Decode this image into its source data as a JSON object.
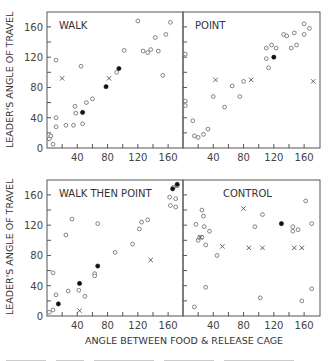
{
  "chart_data": {
    "type": "scatter",
    "layout": "2x2 panels, shared axes",
    "ylabel": "LEADER'S ANGLE OF TRAVEL",
    "xlabel": "ANGLE BETWEEN FOOD & RELEASE CAGE",
    "xticks": [
      40,
      80,
      120,
      160
    ],
    "yticks": [
      0,
      40,
      80,
      120,
      160
    ],
    "xlim": [
      0,
      180
    ],
    "ylim": [
      0,
      180
    ],
    "grid": false,
    "marker_legend": {
      "open": "open circle",
      "filled": "filled circle",
      "cross": "x"
    },
    "panels": [
      {
        "title": "WALK",
        "position": "top-left",
        "open": [
          [
            3,
            12
          ],
          [
            5,
            16
          ],
          [
            8,
            5
          ],
          [
            12,
            28
          ],
          [
            12,
            40
          ],
          [
            12,
            116
          ],
          [
            25,
            30
          ],
          [
            35,
            30
          ],
          [
            37,
            55
          ],
          [
            38,
            46
          ],
          [
            45,
            108
          ],
          [
            47,
            32
          ],
          [
            52,
            60
          ],
          [
            60,
            65
          ],
          [
            92,
            100
          ],
          [
            102,
            129
          ],
          [
            120,
            168
          ],
          [
            127,
            128
          ],
          [
            133,
            126
          ],
          [
            137,
            130
          ],
          [
            143,
            146
          ],
          [
            147,
            128
          ],
          [
            153,
            96
          ],
          [
            157,
            150
          ],
          [
            163,
            166
          ]
        ],
        "filled": [
          [
            47,
            47
          ],
          [
            78,
            81
          ],
          [
            95,
            105
          ]
        ],
        "cross": [
          [
            20,
            92
          ],
          [
            82,
            92
          ]
        ]
      },
      {
        "title": "POINT",
        "position": "top-right",
        "open": [
          [
            3,
            124
          ],
          [
            3,
            62
          ],
          [
            3,
            56
          ],
          [
            13,
            36
          ],
          [
            15,
            16
          ],
          [
            20,
            14
          ],
          [
            27,
            18
          ],
          [
            33,
            25
          ],
          [
            40,
            68
          ],
          [
            55,
            54
          ],
          [
            65,
            82
          ],
          [
            75,
            68
          ],
          [
            80,
            88
          ],
          [
            110,
            132
          ],
          [
            110,
            118
          ],
          [
            113,
            106
          ],
          [
            117,
            136
          ],
          [
            123,
            132
          ],
          [
            133,
            150
          ],
          [
            137,
            148
          ],
          [
            143,
            132
          ],
          [
            147,
            152
          ],
          [
            150,
            136
          ],
          [
            160,
            150
          ],
          [
            160,
            164
          ],
          [
            167,
            158
          ]
        ],
        "filled": [
          [
            120,
            120
          ]
        ],
        "cross": [
          [
            43,
            90
          ],
          [
            90,
            90
          ],
          [
            172,
            88
          ]
        ]
      },
      {
        "title": "WALK THEN POINT",
        "position": "bottom-left",
        "open": [
          [
            3,
            5
          ],
          [
            8,
            8
          ],
          [
            8,
            57
          ],
          [
            12,
            28
          ],
          [
            25,
            107
          ],
          [
            28,
            33
          ],
          [
            33,
            128
          ],
          [
            42,
            34
          ],
          [
            50,
            26
          ],
          [
            63,
            56
          ],
          [
            63,
            53
          ],
          [
            67,
            122
          ],
          [
            90,
            84
          ],
          [
            113,
            95
          ],
          [
            122,
            115
          ],
          [
            125,
            124
          ],
          [
            133,
            127
          ],
          [
            162,
            157
          ],
          [
            163,
            146
          ],
          [
            167,
            170
          ],
          [
            170,
            155
          ],
          [
            170,
            144
          ],
          [
            172,
            172
          ]
        ],
        "filled": [
          [
            15,
            16
          ],
          [
            43,
            43
          ],
          [
            67,
            66
          ],
          [
            166,
            168
          ],
          [
            172,
            174
          ]
        ],
        "cross": [
          [
            43,
            7
          ],
          [
            137,
            74
          ]
        ]
      },
      {
        "title": "CONTROL",
        "position": "bottom-right",
        "open": [
          [
            15,
            12
          ],
          [
            17,
            121
          ],
          [
            20,
            100
          ],
          [
            22,
            104
          ],
          [
            25,
            104
          ],
          [
            25,
            140
          ],
          [
            27,
            132
          ],
          [
            28,
            118
          ],
          [
            30,
            94
          ],
          [
            30,
            38
          ],
          [
            35,
            112
          ],
          [
            45,
            80
          ],
          [
            95,
            118
          ],
          [
            102,
            24
          ],
          [
            105,
            134
          ],
          [
            145,
            118
          ],
          [
            145,
            112
          ],
          [
            152,
            114
          ],
          [
            157,
            20
          ],
          [
            162,
            152
          ],
          [
            170,
            122
          ],
          [
            170,
            36
          ]
        ],
        "filled": [
          [
            130,
            122
          ]
        ],
        "cross": [
          [
            23,
            104
          ],
          [
            52,
            92
          ],
          [
            80,
            142
          ],
          [
            87,
            90
          ],
          [
            105,
            90
          ],
          [
            147,
            90
          ],
          [
            157,
            90
          ]
        ]
      }
    ]
  },
  "labels": {
    "ylabel_top": "LEADER'S ANGLE OF TRAVEL",
    "ylabel_bottom": "LEADER'S ANGLE OF TRAVEL",
    "xlabel": "ANGLE BETWEEN FOOD & RELEASE CAGE"
  }
}
